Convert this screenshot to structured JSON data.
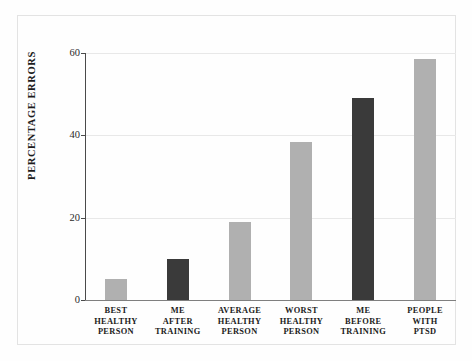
{
  "chart_data": {
    "type": "bar",
    "title": "",
    "xlabel": "",
    "ylabel": "PERCENTAGE ERRORS",
    "ylim": [
      0,
      62
    ],
    "yticks": [
      0,
      20,
      40,
      60
    ],
    "ytick_labels": [
      "0",
      "20",
      "40",
      "60"
    ],
    "grid": true,
    "legend": "none",
    "categories": [
      "BEST HEALTHY PERSON",
      "ME AFTER TRAINING",
      "AVERAGE HEALTHY PERSON",
      "WORST HEALTHY PERSON",
      "ME BEFORE TRAINING",
      "PEOPLE WITH PTSD"
    ],
    "category_lines": [
      [
        "BEST",
        "HEALTHY",
        "PERSON"
      ],
      [
        "ME",
        "AFTER",
        "TRAINING"
      ],
      [
        "AVERAGE",
        "HEALTHY",
        "PERSON"
      ],
      [
        "WORST",
        "HEALTHY",
        "PERSON"
      ],
      [
        "ME",
        "BEFORE",
        "TRAINING"
      ],
      [
        "PEOPLE",
        "WITH",
        "PTSD"
      ]
    ],
    "values": [
      5,
      10,
      19,
      38.5,
      49,
      58.5
    ],
    "bar_colors": [
      "#b0b0b0",
      "#3a3a3a",
      "#b0b0b0",
      "#b0b0b0",
      "#3a3a3a",
      "#b0b0b0"
    ],
    "colors": {
      "light_bar": "#b0b0b0",
      "dark_bar": "#3a3a3a",
      "gridline": "#e8e8e8",
      "axis": "#4a4a4a",
      "background": "#fefefe",
      "text": "#1c1c1c"
    }
  }
}
